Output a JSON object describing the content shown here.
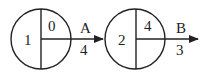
{
  "diagram": {
    "type": "activity-on-node network (node-event diagram)",
    "nodes": [
      {
        "id": "1",
        "label": "1",
        "early_time": "0",
        "late_time": ""
      },
      {
        "id": "2",
        "label": "2",
        "early_time": "4",
        "late_time": ""
      }
    ],
    "activities": [
      {
        "name": "A",
        "duration": "4",
        "from": "1",
        "to": "2"
      },
      {
        "name": "B",
        "duration": "3",
        "from": "2",
        "to": ""
      }
    ],
    "colors": {
      "stroke": "#222222",
      "background": "#ffffff"
    }
  }
}
